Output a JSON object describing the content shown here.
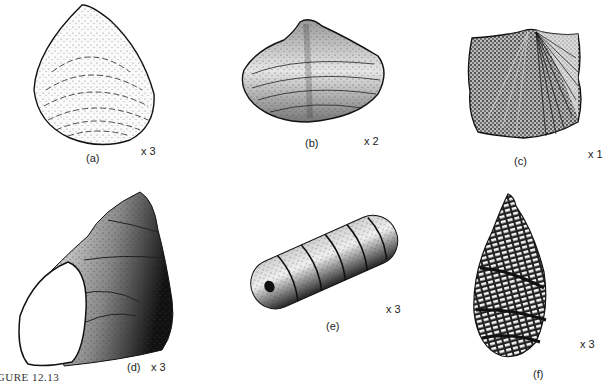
{
  "figure": {
    "caption": "FIGURE 12.13",
    "panels": [
      {
        "id": "a",
        "label": "(a)",
        "scale": "x 3",
        "subject": "brachiopod-smooth-shell"
      },
      {
        "id": "b",
        "label": "(b)",
        "scale": "x 2",
        "subject": "bivalve-shell"
      },
      {
        "id": "c",
        "label": "(c)",
        "scale": "x 1",
        "subject": "ribbed-brachiopod-shell"
      },
      {
        "id": "d",
        "label": "(d)",
        "scale": "x 3",
        "subject": "gastropod-shell"
      },
      {
        "id": "e",
        "label": "(e)",
        "scale": "x 3",
        "subject": "segmented-cylindrical-fossil"
      },
      {
        "id": "f",
        "label": "(f)",
        "scale": "x 3",
        "subject": "teardrop-reticulate-fossil"
      }
    ]
  },
  "colors": {
    "ink": "#111111",
    "paper": "#ffffff",
    "shade": "#555555"
  }
}
